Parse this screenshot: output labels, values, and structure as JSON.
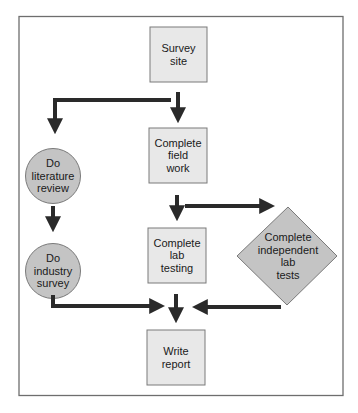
{
  "diagram": {
    "type": "flowchart",
    "colors": {
      "frame": "#6e6e6e",
      "box_fill": "#e8e8e8",
      "box_stroke": "#7a7a7a",
      "shape_fill": "#c4c4c4",
      "arrow": "#2a2a2a"
    },
    "nodes": [
      {
        "id": "survey_site",
        "shape": "rectangle",
        "label": "Survey site",
        "lines": [
          "Survey",
          "site"
        ]
      },
      {
        "id": "field_work",
        "shape": "rectangle",
        "label": "Complete field work",
        "lines": [
          "Complete",
          "field",
          "work"
        ]
      },
      {
        "id": "lab_testing",
        "shape": "rectangle",
        "label": "Complete lab testing",
        "lines": [
          "Complete",
          "lab",
          "testing"
        ]
      },
      {
        "id": "write_report",
        "shape": "rectangle",
        "label": "Write report",
        "lines": [
          "Write",
          "report"
        ]
      },
      {
        "id": "literature_review",
        "shape": "circle",
        "label": "Do literature review",
        "lines": [
          "Do",
          "literature",
          "review"
        ]
      },
      {
        "id": "industry_survey",
        "shape": "circle",
        "label": "Do industry survey",
        "lines": [
          "Do",
          "industry",
          "survey"
        ]
      },
      {
        "id": "independent_lab_tests",
        "shape": "diamond",
        "label": "Complete independent lab tests",
        "lines": [
          "Complete",
          "independent",
          "lab",
          "tests"
        ]
      }
    ],
    "edges": [
      {
        "from": "survey_site",
        "to": "field_work"
      },
      {
        "from": "survey_site",
        "to": "literature_review"
      },
      {
        "from": "literature_review",
        "to": "industry_survey"
      },
      {
        "from": "field_work",
        "to": "lab_testing"
      },
      {
        "from": "field_work",
        "to": "independent_lab_tests"
      },
      {
        "from": "lab_testing",
        "to": "write_report"
      },
      {
        "from": "industry_survey",
        "to": "write_report"
      },
      {
        "from": "independent_lab_tests",
        "to": "write_report"
      }
    ]
  }
}
